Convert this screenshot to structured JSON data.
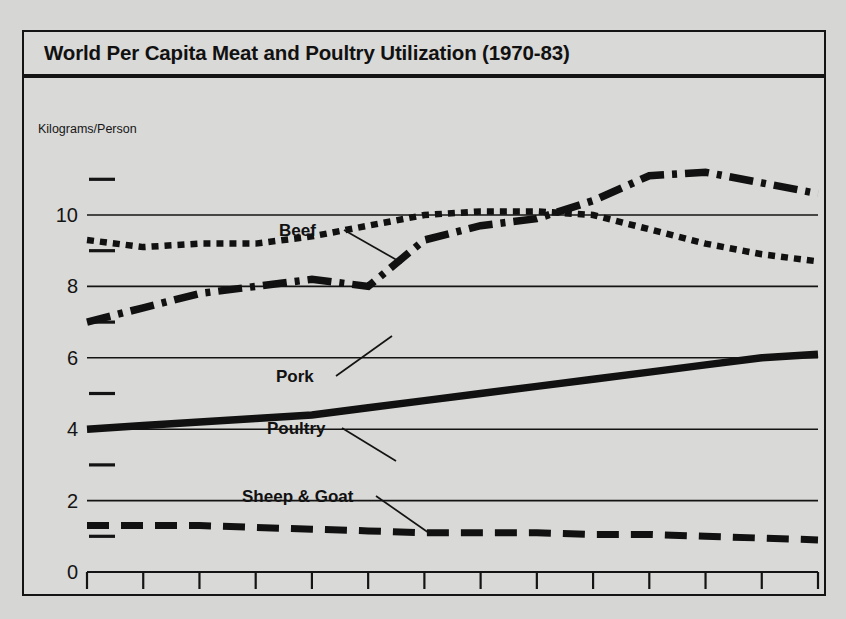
{
  "figure": {
    "title": "World Per Capita Meat and Poultry Utilization (1970-83)",
    "axis_unit_label": "Kilograms/Person",
    "background_color": "#d9d9d7",
    "ink_color": "#141414"
  },
  "chart_data": {
    "type": "line",
    "title": "World Per Capita Meat and Poultry Utilization (1970-83)",
    "xlabel": "",
    "ylabel": "Kilograms/Person",
    "xlim": [
      1970,
      1983
    ],
    "ylim": [
      0,
      11.6
    ],
    "grid": true,
    "legend": "inline-annotations",
    "x": [
      1970,
      1971,
      1972,
      1973,
      1974,
      1975,
      1976,
      1977,
      1978,
      1979,
      1980,
      1981,
      1982,
      1983
    ],
    "x_tick_labels": [
      "1970",
      "1975",
      "1980",
      "1983"
    ],
    "x_tick_values": [
      1970,
      1975,
      1980,
      1983
    ],
    "y_tick_labels": [
      "0",
      "2",
      "4",
      "6",
      "8",
      "10"
    ],
    "y_tick_values": [
      0,
      2,
      4,
      6,
      8,
      10
    ],
    "y_minor_tick_values": [
      1,
      3,
      5,
      7,
      9,
      11
    ],
    "series": [
      {
        "name": "Beef",
        "line_style": "dotted",
        "label": "Beef",
        "values": [
          9.3,
          9.1,
          9.2,
          9.2,
          9.4,
          9.7,
          10.0,
          10.1,
          10.1,
          10.0,
          9.6,
          9.2,
          8.9,
          8.7
        ]
      },
      {
        "name": "Pork",
        "line_style": "dash-dot",
        "label": "Pork",
        "values": [
          7.0,
          7.4,
          7.8,
          8.0,
          8.2,
          8.0,
          9.3,
          9.7,
          9.9,
          10.4,
          11.1,
          11.2,
          10.9,
          10.6
        ]
      },
      {
        "name": "Poultry",
        "line_style": "solid",
        "label": "Poultry",
        "values": [
          4.0,
          4.1,
          4.2,
          4.3,
          4.4,
          4.6,
          4.8,
          5.0,
          5.2,
          5.4,
          5.6,
          5.8,
          6.0,
          6.1
        ]
      },
      {
        "name": "Sheep & Goat",
        "line_style": "dashed",
        "label": "Sheep & Goat",
        "values": [
          1.3,
          1.3,
          1.3,
          1.25,
          1.2,
          1.15,
          1.1,
          1.1,
          1.1,
          1.05,
          1.05,
          1.0,
          0.95,
          0.9
        ]
      }
    ]
  }
}
